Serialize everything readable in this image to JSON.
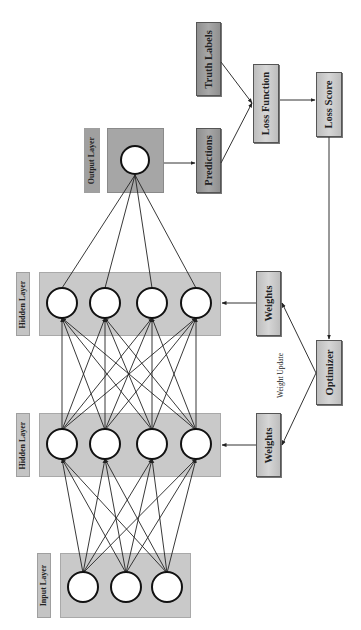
{
  "diagram": {
    "layers": [
      {
        "id": "input",
        "label": "Input Layer",
        "neurons": 3
      },
      {
        "id": "hidden1",
        "label": "Hidden Layer",
        "neurons": 4
      },
      {
        "id": "hidden2",
        "label": "Hidden Layer",
        "neurons": 4
      },
      {
        "id": "output",
        "label": "Output Layer",
        "neurons": 1
      }
    ],
    "blocks": {
      "predictions": "Predictions",
      "truth_labels": "Truth Labels",
      "loss_function": "Loss Function",
      "loss_score": "Loss Score",
      "optimizer": "Optimizer",
      "weights_top": "Weights",
      "weights_bottom": "Weights"
    },
    "annotations": {
      "weight_update": "Weight Update"
    },
    "edges": [
      {
        "from": "input",
        "to": "hidden1",
        "type": "fully-connected"
      },
      {
        "from": "hidden1",
        "to": "hidden2",
        "type": "fully-connected"
      },
      {
        "from": "hidden2",
        "to": "output",
        "type": "fully-connected"
      },
      {
        "from": "output",
        "to": "predictions"
      },
      {
        "from": "predictions",
        "to": "loss_function"
      },
      {
        "from": "truth_labels",
        "to": "loss_function"
      },
      {
        "from": "loss_function",
        "to": "loss_score"
      },
      {
        "from": "loss_score",
        "to": "optimizer"
      },
      {
        "from": "optimizer",
        "to": "weights_top"
      },
      {
        "from": "optimizer",
        "to": "weights_bottom"
      },
      {
        "from": "weights_top",
        "to": "hidden2"
      },
      {
        "from": "weights_bottom",
        "to": "hidden1"
      }
    ],
    "colors": {
      "layer_fill": "#c9c9c9",
      "output_fill": "#a6a6a6",
      "dark_block": "#9c9c9c",
      "light_block": "#cfcfcf",
      "line": "#222222"
    }
  }
}
